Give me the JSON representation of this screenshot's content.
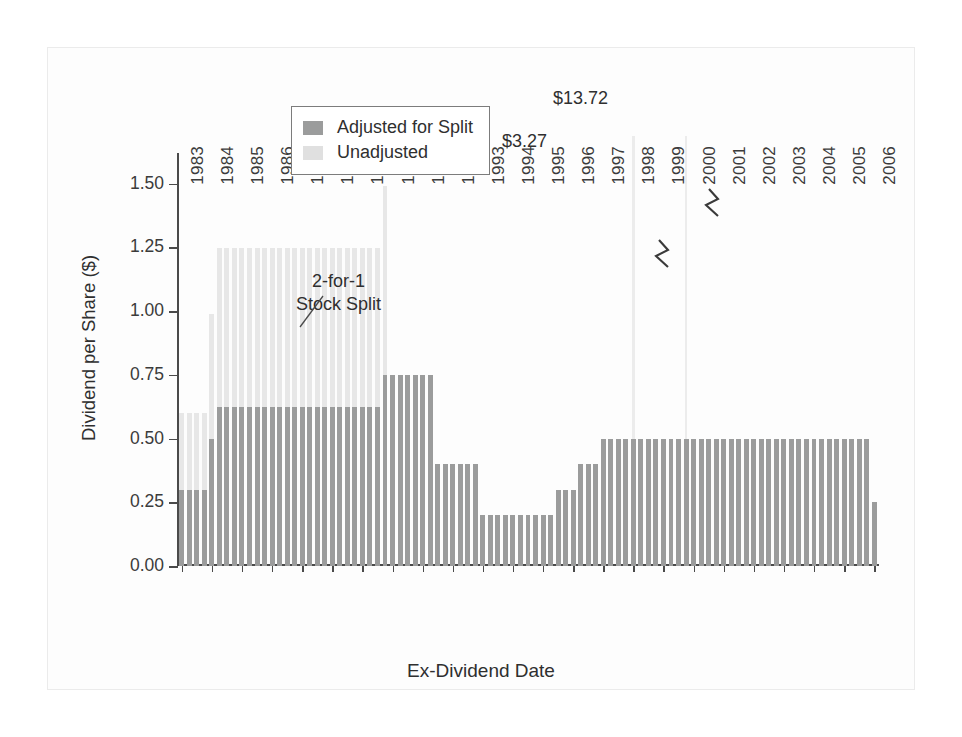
{
  "chart_data": {
    "type": "bar",
    "title": "",
    "xlabel": "Ex-Dividend Date",
    "ylabel": "Dividend per Share ($)",
    "ylim": [
      0.0,
      1.6875
    ],
    "yticks": [
      0.0,
      0.25,
      0.5,
      0.75,
      1.0,
      1.25,
      1.5
    ],
    "ytick_labels": [
      "0.00",
      "0.25",
      "0.50",
      "0.75",
      "1.00",
      "1.25",
      "1.50"
    ],
    "grid": false,
    "legend_position": "top-center",
    "stacked": true,
    "bar_count": 93,
    "x_range": [
      "1983",
      "2006"
    ],
    "xtick_labels": [
      "1983",
      "1984",
      "1985",
      "1986",
      "1987",
      "1988",
      "1989",
      "1990",
      "1991",
      "1992",
      "1993",
      "1994",
      "1995",
      "1996",
      "1997",
      "1998",
      "1999",
      "2000",
      "2001",
      "2002",
      "2003",
      "2004",
      "2005",
      "2006"
    ],
    "series": [
      {
        "name": "Adjusted for Split",
        "color": "#9b9c9c"
      },
      {
        "name": "Unadjusted",
        "color": "#e7e7e7"
      }
    ],
    "bars": [
      {
        "x": "1983Q1",
        "adjusted": 0.3,
        "unadjusted_top": 0.6
      },
      {
        "x": "1983Q2",
        "adjusted": 0.3,
        "unadjusted_top": 0.6
      },
      {
        "x": "1983Q3",
        "adjusted": 0.3,
        "unadjusted_top": 0.6
      },
      {
        "x": "1983Q4",
        "adjusted": 0.3,
        "unadjusted_top": 0.6
      },
      {
        "x": "1984Q1",
        "adjusted": 0.5,
        "unadjusted_top": 0.99
      },
      {
        "x": "1984Q2",
        "adjusted": 0.625,
        "unadjusted_top": 1.25
      },
      {
        "x": "1984Q3",
        "adjusted": 0.625,
        "unadjusted_top": 1.25
      },
      {
        "x": "1984Q4",
        "adjusted": 0.625,
        "unadjusted_top": 1.25
      },
      {
        "x": "1985Q1",
        "adjusted": 0.625,
        "unadjusted_top": 1.25
      },
      {
        "x": "1985Q2",
        "adjusted": 0.625,
        "unadjusted_top": 1.25
      },
      {
        "x": "1985Q3",
        "adjusted": 0.625,
        "unadjusted_top": 1.25
      },
      {
        "x": "1985Q4",
        "adjusted": 0.625,
        "unadjusted_top": 1.25
      },
      {
        "x": "1986Q1",
        "adjusted": 0.625,
        "unadjusted_top": 1.25
      },
      {
        "x": "1986Q2",
        "adjusted": 0.625,
        "unadjusted_top": 1.25
      },
      {
        "x": "1986Q3",
        "adjusted": 0.625,
        "unadjusted_top": 1.25
      },
      {
        "x": "1986Q4",
        "adjusted": 0.625,
        "unadjusted_top": 1.25
      },
      {
        "x": "1987Q1",
        "adjusted": 0.625,
        "unadjusted_top": 1.25
      },
      {
        "x": "1987Q2",
        "adjusted": 0.625,
        "unadjusted_top": 1.25
      },
      {
        "x": "1987Q3",
        "adjusted": 0.625,
        "unadjusted_top": 1.25
      },
      {
        "x": "1987Q4",
        "adjusted": 0.625,
        "unadjusted_top": 1.25
      },
      {
        "x": "1988Q1",
        "adjusted": 0.625,
        "unadjusted_top": 1.25
      },
      {
        "x": "1988Q2",
        "adjusted": 0.625,
        "unadjusted_top": 1.25
      },
      {
        "x": "1988Q3",
        "adjusted": 0.625,
        "unadjusted_top": 1.25
      },
      {
        "x": "1988Q4",
        "adjusted": 0.625,
        "unadjusted_top": 1.25
      },
      {
        "x": "1989Q1",
        "adjusted": 0.625,
        "unadjusted_top": 1.25
      },
      {
        "x": "1989Q2",
        "adjusted": 0.625,
        "unadjusted_top": 1.25
      },
      {
        "x": "1989Q3",
        "adjusted": 0.625,
        "unadjusted_top": 1.25
      },
      {
        "x": "1989Q4",
        "adjusted": 0.75,
        "unadjusted_top": 1.49
      },
      {
        "x": "1990Q1",
        "adjusted": 0.75,
        "unadjusted_top": 0
      },
      {
        "x": "1990Q2",
        "adjusted": 0.75,
        "unadjusted_top": 0
      },
      {
        "x": "1990Q3",
        "adjusted": 0.75,
        "unadjusted_top": 0
      },
      {
        "x": "1990Q4",
        "adjusted": 0.75,
        "unadjusted_top": 0
      },
      {
        "x": "1991Q1",
        "adjusted": 0.75,
        "unadjusted_top": 0
      },
      {
        "x": "1991Q2",
        "adjusted": 0.75,
        "unadjusted_top": 0
      },
      {
        "x": "1991Q3",
        "adjusted": 0.4,
        "unadjusted_top": 0
      },
      {
        "x": "1991Q4",
        "adjusted": 0.4,
        "unadjusted_top": 0
      },
      {
        "x": "1992Q1",
        "adjusted": 0.4,
        "unadjusted_top": 0
      },
      {
        "x": "1992Q2",
        "adjusted": 0.4,
        "unadjusted_top": 0
      },
      {
        "x": "1992Q3",
        "adjusted": 0.4,
        "unadjusted_top": 0
      },
      {
        "x": "1992Q4",
        "adjusted": 0.4,
        "unadjusted_top": 0
      },
      {
        "x": "1993Q1",
        "adjusted": 0.2,
        "unadjusted_top": 0
      },
      {
        "x": "1993Q2",
        "adjusted": 0.2,
        "unadjusted_top": 0
      },
      {
        "x": "1993Q3",
        "adjusted": 0.2,
        "unadjusted_top": 0
      },
      {
        "x": "1993Q4",
        "adjusted": 0.2,
        "unadjusted_top": 0
      },
      {
        "x": "1994Q1",
        "adjusted": 0.2,
        "unadjusted_top": 0
      },
      {
        "x": "1994Q2",
        "adjusted": 0.2,
        "unadjusted_top": 0
      },
      {
        "x": "1994Q3",
        "adjusted": 0.2,
        "unadjusted_top": 0
      },
      {
        "x": "1994Q4",
        "adjusted": 0.2,
        "unadjusted_top": 0
      },
      {
        "x": "1995Q1",
        "adjusted": 0.2,
        "unadjusted_top": 0
      },
      {
        "x": "1995Q2",
        "adjusted": 0.2,
        "unadjusted_top": 0
      },
      {
        "x": "1995Q3",
        "adjusted": 0.3,
        "unadjusted_top": 0
      },
      {
        "x": "1995Q4",
        "adjusted": 0.3,
        "unadjusted_top": 0
      },
      {
        "x": "1996Q1",
        "adjusted": 0.3,
        "unadjusted_top": 0
      },
      {
        "x": "1996Q2",
        "adjusted": 0.4,
        "unadjusted_top": 0
      },
      {
        "x": "1996Q3",
        "adjusted": 0.4,
        "unadjusted_top": 0
      },
      {
        "x": "1996Q4",
        "adjusted": 0.4,
        "unadjusted_top": 0
      },
      {
        "x": "1997Q1",
        "adjusted": 0.5,
        "unadjusted_top": 0
      },
      {
        "x": "1997Q2",
        "adjusted": 0.5,
        "unadjusted_top": 0
      },
      {
        "x": "1997Q3",
        "adjusted": 0.5,
        "unadjusted_top": 0
      },
      {
        "x": "1997Q4",
        "adjusted": 0.5,
        "unadjusted_top": 0
      },
      {
        "x": "1998Q1",
        "adjusted": 0.5,
        "unadjusted_top": 0,
        "spike": 3.27,
        "spike_label": "$3.27"
      },
      {
        "x": "1998Q2",
        "adjusted": 0.5,
        "unadjusted_top": 0
      },
      {
        "x": "1998Q3",
        "adjusted": 0.5,
        "unadjusted_top": 0
      },
      {
        "x": "1998Q4",
        "adjusted": 0.5,
        "unadjusted_top": 0
      },
      {
        "x": "1999Q1",
        "adjusted": 0.5,
        "unadjusted_top": 0
      },
      {
        "x": "1999Q2",
        "adjusted": 0.5,
        "unadjusted_top": 0
      },
      {
        "x": "1999Q3",
        "adjusted": 0.5,
        "unadjusted_top": 0
      },
      {
        "x": "1999Q4",
        "adjusted": 0.5,
        "unadjusted_top": 0,
        "spike": 13.72,
        "spike_label": "$13.72"
      },
      {
        "x": "2000Q1",
        "adjusted": 0.5,
        "unadjusted_top": 0
      },
      {
        "x": "2000Q2",
        "adjusted": 0.5,
        "unadjusted_top": 0
      },
      {
        "x": "2000Q3",
        "adjusted": 0.5,
        "unadjusted_top": 0
      },
      {
        "x": "2000Q4",
        "adjusted": 0.5,
        "unadjusted_top": 0
      },
      {
        "x": "2001Q1",
        "adjusted": 0.5,
        "unadjusted_top": 0
      },
      {
        "x": "2001Q2",
        "adjusted": 0.5,
        "unadjusted_top": 0
      },
      {
        "x": "2001Q3",
        "adjusted": 0.5,
        "unadjusted_top": 0
      },
      {
        "x": "2001Q4",
        "adjusted": 0.5,
        "unadjusted_top": 0
      },
      {
        "x": "2002Q1",
        "adjusted": 0.5,
        "unadjusted_top": 0
      },
      {
        "x": "2002Q2",
        "adjusted": 0.5,
        "unadjusted_top": 0
      },
      {
        "x": "2002Q3",
        "adjusted": 0.5,
        "unadjusted_top": 0
      },
      {
        "x": "2002Q4",
        "adjusted": 0.5,
        "unadjusted_top": 0
      },
      {
        "x": "2003Q1",
        "adjusted": 0.5,
        "unadjusted_top": 0
      },
      {
        "x": "2003Q2",
        "adjusted": 0.5,
        "unadjusted_top": 0
      },
      {
        "x": "2003Q3",
        "adjusted": 0.5,
        "unadjusted_top": 0
      },
      {
        "x": "2003Q4",
        "adjusted": 0.5,
        "unadjusted_top": 0
      },
      {
        "x": "2004Q1",
        "adjusted": 0.5,
        "unadjusted_top": 0
      },
      {
        "x": "2004Q2",
        "adjusted": 0.5,
        "unadjusted_top": 0
      },
      {
        "x": "2004Q3",
        "adjusted": 0.5,
        "unadjusted_top": 0
      },
      {
        "x": "2004Q4",
        "adjusted": 0.5,
        "unadjusted_top": 0
      },
      {
        "x": "2005Q1",
        "adjusted": 0.5,
        "unadjusted_top": 0
      },
      {
        "x": "2005Q2",
        "adjusted": 0.5,
        "unadjusted_top": 0
      },
      {
        "x": "2005Q3",
        "adjusted": 0.5,
        "unadjusted_top": 0
      },
      {
        "x": "2005Q4",
        "adjusted": 0.5,
        "unadjusted_top": 0
      },
      {
        "x": "2006Q1",
        "adjusted": 0.25,
        "unadjusted_top": 0
      }
    ],
    "annotations": [
      {
        "id": "stock-split",
        "text_line1": "2-for-1",
        "text_line2": "Stock Split",
        "points_to": "1989Q4"
      },
      {
        "id": "spike-1998",
        "text": "$3.27"
      },
      {
        "id": "spike-1999",
        "text": "$13.72"
      }
    ]
  },
  "legend": {
    "items": [
      {
        "label": "Adjusted for Split",
        "color": "#9b9c9c"
      },
      {
        "label": "Unadjusted",
        "color": "#e0e0e0"
      }
    ]
  },
  "annotation_text": {
    "split_line1": "2-for-1",
    "split_line2": "Stock Split",
    "spike_1998": "$3.27",
    "spike_1999": "$13.72"
  },
  "axes": {
    "y_title": "Dividend per Share ($)",
    "x_title": "Ex-Dividend Date"
  }
}
